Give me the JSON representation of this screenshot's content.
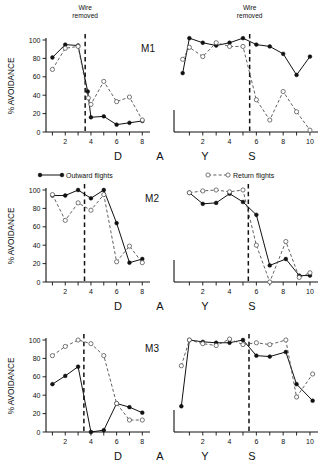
{
  "figure": {
    "ylabel": "% AVOIDANCE",
    "xlabel_letters": [
      "D",
      "A",
      "Y",
      "S"
    ],
    "annotation": "Wire\nremoved",
    "annotation_line1": "Wire",
    "annotation_line2": "removed",
    "yticks": [
      "0",
      "20",
      "40",
      "60",
      "80",
      "100"
    ],
    "xticks_left": [
      "2",
      "4",
      "6",
      "8"
    ],
    "xticks_right": [
      "2",
      "4",
      "6",
      "8",
      "10"
    ],
    "panels": [
      "M1",
      "M2",
      "M3"
    ]
  },
  "legend": {
    "position": "between-M1-and-M2",
    "entries": [
      {
        "label": "Outward flights",
        "marker": "filled-circle",
        "line": "solid",
        "color": "#111111"
      },
      {
        "label": "Return flights",
        "marker": "open-circle",
        "line": "dashed",
        "color": "#444444"
      }
    ]
  },
  "chart_data": {
    "type": "line",
    "title": "",
    "xlabel": "DAYS",
    "ylabel": "% AVOIDANCE",
    "ylim": [
      0,
      100
    ],
    "grid": false,
    "legend_position": "top-center",
    "panels": [
      {
        "name": "M1",
        "subplots": [
          {
            "side": "left",
            "xlim": [
              0.5,
              8.6
            ],
            "wire_removed_x": 3.55,
            "series": [
              {
                "name": "Outward flights",
                "marker": "filled-circle",
                "line": "solid",
                "x": [
                  1,
                  2,
                  3,
                  3.75,
                  4,
                  5,
                  6,
                  7,
                  8
                ],
                "y": [
                  81,
                  95,
                  94,
                  44,
                  16,
                  17,
                  8,
                  10,
                  12
                ]
              },
              {
                "name": "Return flights",
                "marker": "open-circle",
                "line": "dashed",
                "x": [
                  1,
                  2,
                  3,
                  3.8,
                  4,
                  5,
                  6,
                  7,
                  8
                ],
                "y": [
                  68,
                  91,
                  93,
                  37,
                  30,
                  55,
                  33,
                  38,
                  13
                ]
              }
            ]
          },
          {
            "side": "right",
            "xlim": [
              0.3,
              10.6
            ],
            "wire_removed_x": 5.5,
            "series": [
              {
                "name": "Outward flights",
                "marker": "filled-circle",
                "line": "solid",
                "x": [
                  0.5,
                  1,
                  2,
                  3,
                  4,
                  5,
                  6,
                  7,
                  8,
                  9,
                  10
                ],
                "y": [
                  64,
                  102,
                  97,
                  94,
                  97,
                  102,
                  95,
                  93,
                  85,
                  62,
                  82
                ]
              },
              {
                "name": "Return flights",
                "marker": "open-circle",
                "line": "dashed",
                "x": [
                  0.5,
                  1,
                  2,
                  3,
                  4,
                  5,
                  6,
                  7,
                  8,
                  9,
                  10
                ],
                "y": [
                  79,
                  92,
                  82,
                  97,
                  93,
                  93,
                  35,
                  13,
                  44,
                  22,
                  2
                ]
              }
            ]
          }
        ]
      },
      {
        "name": "M2",
        "subplots": [
          {
            "side": "left",
            "xlim": [
              0.5,
              8.6
            ],
            "wire_removed_x": 3.5,
            "series": [
              {
                "name": "Outward flights",
                "marker": "filled-circle",
                "line": "solid",
                "x": [
                  1,
                  2,
                  3,
                  4,
                  5,
                  6,
                  7,
                  8
                ],
                "y": [
                  94,
                  94,
                  100,
                  91,
                  100,
                  64,
                  21,
                  25
                ]
              },
              {
                "name": "Return flights",
                "marker": "open-circle",
                "line": "dashed",
                "x": [
                  1,
                  2,
                  3,
                  4,
                  5,
                  6,
                  7,
                  8
                ],
                "y": [
                  95,
                  67,
                  86,
                  78,
                  95,
                  22,
                  39,
                  21
                ]
              }
            ]
          },
          {
            "side": "right",
            "xlim": [
              0.3,
              10.6
            ],
            "wire_removed_x": 5.4,
            "series": [
              {
                "name": "Outward flights",
                "marker": "filled-circle",
                "line": "solid",
                "x": [
                  1,
                  2,
                  3,
                  4,
                  5,
                  6,
                  7,
                  8.2,
                  9.2,
                  10
                ],
                "y": [
                  97,
                  85,
                  86,
                  96,
                  87,
                  73,
                  18,
                  25,
                  7,
                  7
                ]
              },
              {
                "name": "Return flights",
                "marker": "open-circle",
                "line": "dashed",
                "x": [
                  1,
                  2,
                  3,
                  4,
                  5,
                  6,
                  7,
                  8.2,
                  9.2,
                  10
                ],
                "y": [
                  97,
                  99,
                  100,
                  98,
                  100,
                  40,
                  0,
                  44,
                  5,
                  10
                ]
              }
            ]
          }
        ]
      },
      {
        "name": "M3",
        "subplots": [
          {
            "side": "left",
            "xlim": [
              0.5,
              8.6
            ],
            "wire_removed_x": 3.45,
            "series": [
              {
                "name": "Outward flights",
                "marker": "filled-circle",
                "line": "solid",
                "x": [
                  1,
                  2,
                  3,
                  4,
                  5,
                  6,
                  7,
                  8
                ],
                "y": [
                  52,
                  61,
                  71,
                  0,
                  2,
                  31,
                  27,
                  21
                ]
              },
              {
                "name": "Return flights",
                "marker": "open-circle",
                "line": "dashed",
                "x": [
                  1,
                  2,
                  3,
                  4,
                  5,
                  6,
                  7,
                  8
                ],
                "y": [
                  83,
                  93,
                  100,
                  96,
                  83,
                  31,
                  13,
                  13
                ]
              }
            ]
          },
          {
            "side": "right",
            "xlim": [
              0.3,
              10.6
            ],
            "wire_removed_x": 5.45,
            "series": [
              {
                "name": "Outward flights",
                "marker": "filled-circle",
                "line": "solid",
                "x": [
                  0.4,
                  1,
                  2,
                  3,
                  4,
                  5,
                  6,
                  7,
                  8.2,
                  9,
                  10.2
                ],
                "y": [
                  28,
                  100,
                  98,
                  97,
                  97,
                  100,
                  83,
                  82,
                  87,
                  52,
                  34
                ]
              },
              {
                "name": "Return flights",
                "marker": "open-circle",
                "line": "dashed",
                "x": [
                  0.4,
                  1,
                  2,
                  3,
                  4,
                  5,
                  6,
                  7,
                  8.2,
                  9,
                  10.2
                ],
                "y": [
                  72,
                  100,
                  96,
                  94,
                  101,
                  95,
                  97,
                  95,
                  100,
                  38,
                  63
                ]
              }
            ]
          }
        ]
      }
    ]
  }
}
